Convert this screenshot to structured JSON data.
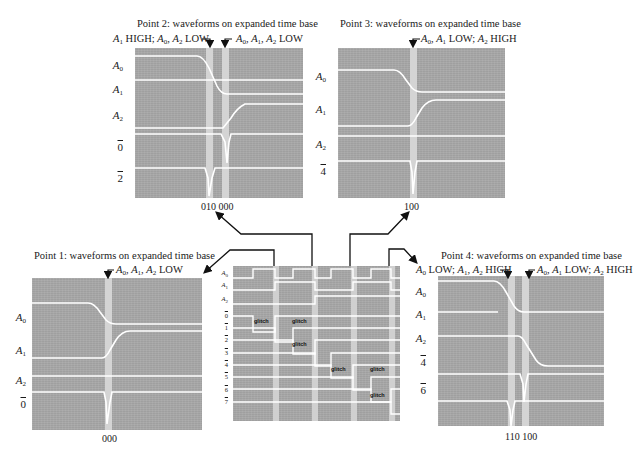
{
  "figure": {
    "colors": {
      "screen": "#a8a8a8",
      "trace": "#ffffff",
      "band": "#d4d4d4",
      "ink": "#1a1a1a",
      "glitch_box": "#3a3a3a"
    }
  },
  "center_panel": {
    "labels": [
      "A0",
      "A1",
      "A2",
      "0̄",
      "1̄",
      "2̄",
      "3̄",
      "4̄",
      "5̄",
      "6̄",
      "7̄"
    ],
    "glitch_label": "glitch",
    "glitch_count": 6
  },
  "point1": {
    "title": "Point 1:  waveforms on expanded time base",
    "annotation": "A0, A1, A2 LOW",
    "labels": [
      "A0",
      "A1",
      "A2",
      "0̄"
    ],
    "tick": "000"
  },
  "point2": {
    "title": "Point 2:  waveforms on expanded time base",
    "annotation_left": "A1 HIGH; A0, A2 LOW",
    "annotation_right": "A0, A1, A2 LOW",
    "labels": [
      "A0",
      "A1",
      "A2",
      "0̄",
      "2̄"
    ],
    "tick": "010 000"
  },
  "point3": {
    "title": "Point 3:  waveforms on expanded time base",
    "annotation": "A0, A1 LOW; A2 HIGH",
    "labels": [
      "A0",
      "A1",
      "A2",
      "4̄"
    ],
    "tick": "100"
  },
  "point4": {
    "title": "Point 4:  waveforms on expanded time base",
    "annotation_left": "A0 LOW; A1, A2 HIGH",
    "annotation_right": "A0, A1 LOW; A2 HIGH",
    "labels": [
      "A0",
      "A1",
      "A2",
      "4̄",
      "6̄"
    ],
    "tick": "110 100"
  }
}
